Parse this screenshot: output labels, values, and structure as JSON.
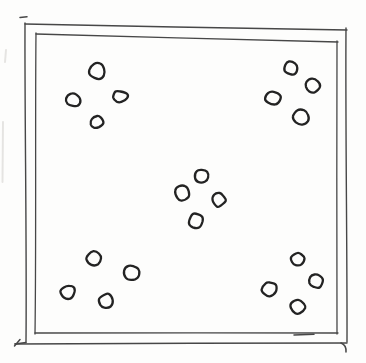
{
  "canvas": {
    "width": 366,
    "height": 363,
    "paper_color": "#fdfdfc",
    "frame_ink_color": "#474747",
    "dot_ink_color": "#232323",
    "smudge_color": "#cfcdc9"
  },
  "frame": {
    "outer": {
      "left": 25,
      "top": 24,
      "right": 347,
      "bottom": 342,
      "top_right_y": 30,
      "stroke_width": 1.4
    },
    "inner": {
      "left": 36,
      "top": 34,
      "right": 337,
      "bottom": 333,
      "top_right_y": 42,
      "stroke_width": 1.3
    },
    "accents": [
      {
        "name": "top-left-overshoot-tick",
        "d": "M 20,17.5 L 27,16.8"
      },
      {
        "name": "bottom-left-overshoot",
        "d": "M 26,342.5 L 15,344"
      },
      {
        "name": "bottom-left-hook",
        "d": "M 20,339.5 L 14.5,346"
      },
      {
        "name": "bottom-right-hook",
        "d": "M 341,343 Q 346.5,345 346,352"
      },
      {
        "name": "inner-bottom-restroke",
        "d": "M 294,335 L 314,334.2"
      }
    ]
  },
  "pattern": "quincunx-five-clusters-of-four-dots",
  "clusters": [
    {
      "name": "top-left",
      "dots": [
        {
          "cx": 97,
          "cy": 71,
          "rx": 8,
          "ry": 7.5
        },
        {
          "cx": 73,
          "cy": 100,
          "rx": 7,
          "ry": 6.5
        },
        {
          "cx": 120,
          "cy": 96.5,
          "rx": 7.5,
          "ry": 5.5
        },
        {
          "cx": 97,
          "cy": 122,
          "rx": 6,
          "ry": 6
        }
      ]
    },
    {
      "name": "top-right",
      "dots": [
        {
          "cx": 291,
          "cy": 68,
          "rx": 6.5,
          "ry": 6.5
        },
        {
          "cx": 313,
          "cy": 86,
          "rx": 7,
          "ry": 7
        },
        {
          "cx": 273,
          "cy": 98,
          "rx": 7.5,
          "ry": 6.5
        },
        {
          "cx": 301,
          "cy": 117,
          "rx": 7.5,
          "ry": 7
        }
      ]
    },
    {
      "name": "center",
      "dots": [
        {
          "cx": 202,
          "cy": 176,
          "rx": 6.5,
          "ry": 6.5
        },
        {
          "cx": 182,
          "cy": 193,
          "rx": 7.5,
          "ry": 7
        },
        {
          "cx": 219,
          "cy": 200,
          "rx": 6.5,
          "ry": 6.5
        },
        {
          "cx": 196,
          "cy": 221,
          "rx": 7,
          "ry": 7
        }
      ]
    },
    {
      "name": "bottom-left",
      "dots": [
        {
          "cx": 94,
          "cy": 258,
          "rx": 7,
          "ry": 7
        },
        {
          "cx": 132,
          "cy": 273,
          "rx": 8,
          "ry": 7.5
        },
        {
          "cx": 68,
          "cy": 292,
          "rx": 7,
          "ry": 6.5
        },
        {
          "cx": 106,
          "cy": 301,
          "rx": 6.5,
          "ry": 7
        }
      ]
    },
    {
      "name": "bottom-right",
      "dots": [
        {
          "cx": 298,
          "cy": 259,
          "rx": 6.5,
          "ry": 6
        },
        {
          "cx": 316,
          "cy": 281,
          "rx": 7,
          "ry": 7
        },
        {
          "cx": 269,
          "cy": 289,
          "rx": 7.5,
          "ry": 7
        },
        {
          "cx": 298,
          "cy": 307,
          "rx": 7.5,
          "ry": 6.5
        }
      ]
    },
    {
      "name": "left-margin-smudges",
      "dots": []
    }
  ],
  "smudges": [
    {
      "d": "M 3,122 L 2.5,182"
    },
    {
      "d": "M 6,50 L 5,62"
    }
  ],
  "dot_stroke_width": 2.3
}
